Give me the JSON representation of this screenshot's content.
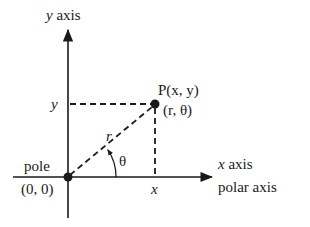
{
  "diagram": {
    "labels": {
      "y_axis": "y axis",
      "y_axis_var": "y",
      "y_axis_word": "axis",
      "x_axis": "x axis",
      "x_axis_var": "x",
      "x_axis_word": "axis",
      "polar_axis": "polar axis",
      "pole": "pole",
      "origin": "(0, 0)",
      "point_rect": "P(x, y)",
      "point_polar": "(r, θ)",
      "y_tick": "y",
      "x_tick": "x",
      "radius": "r",
      "angle": "θ"
    },
    "colors": {
      "ink": "#1a1a1a",
      "background": "#ffffff"
    }
  }
}
